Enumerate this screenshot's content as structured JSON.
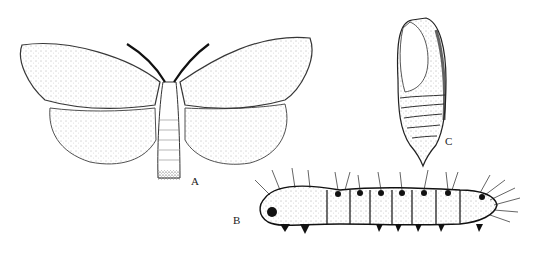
{
  "figure": {
    "labels": {
      "adult": "A",
      "larva": "B",
      "pupa": "C"
    }
  }
}
